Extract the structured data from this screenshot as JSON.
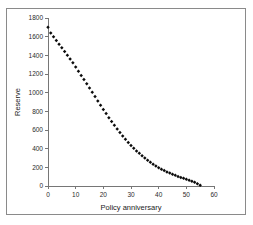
{
  "chart_data": {
    "type": "scatter",
    "title": "",
    "subtitle": "",
    "xlabel": "Policy anniversary",
    "ylabel": "Reserve",
    "xlim": [
      0,
      60
    ],
    "ylim": [
      0,
      1800
    ],
    "xticks": [
      0,
      10,
      20,
      30,
      40,
      50,
      60
    ],
    "yticks": [
      0,
      200,
      400,
      600,
      800,
      1000,
      1200,
      1400,
      1600,
      1800
    ],
    "grid": false,
    "legend": null,
    "legend_position": "none",
    "marker_style": "filled-diamond",
    "marker_color": "#0b0b0b",
    "series": [
      {
        "name": "Reserve",
        "x": [
          0,
          1,
          2,
          3,
          4,
          5,
          6,
          7,
          8,
          9,
          10,
          11,
          12,
          13,
          14,
          15,
          16,
          17,
          18,
          19,
          20,
          21,
          22,
          23,
          24,
          25,
          26,
          27,
          28,
          29,
          30,
          31,
          32,
          33,
          34,
          35,
          36,
          37,
          38,
          39,
          40,
          41,
          42,
          43,
          44,
          45,
          46,
          47,
          48,
          49,
          50,
          51,
          52,
          53,
          54,
          55
        ],
        "values": [
          1700,
          1640,
          1600,
          1560,
          1520,
          1480,
          1440,
          1400,
          1360,
          1320,
          1275,
          1230,
          1185,
          1140,
          1095,
          1050,
          1005,
          958,
          912,
          866,
          820,
          776,
          732,
          690,
          650,
          610,
          572,
          536,
          500,
          466,
          434,
          404,
          376,
          350,
          325,
          300,
          276,
          254,
          233,
          214,
          196,
          180,
          165,
          151,
          138,
          126,
          114,
          103,
          92,
          82,
          72,
          62,
          52,
          40,
          25,
          8
        ]
      }
    ]
  },
  "axis_labels": {
    "x_title": "Policy anniversary",
    "y_title": "Reserve"
  }
}
